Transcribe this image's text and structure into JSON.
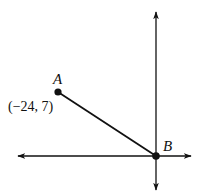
{
  "diagram": {
    "type": "coordinate-plane",
    "axes": {
      "color": "#111111",
      "origin_px": [
        156,
        156
      ],
      "x_axis": {
        "left_px": 16,
        "right_px": 193,
        "y_px": 156
      },
      "y_axis": {
        "top_px": 10,
        "bottom_px": 192,
        "x_px": 156
      }
    },
    "points": [
      {
        "id": "A",
        "label": "A",
        "coord_label": "(−24, 7)",
        "x": -24,
        "y": 7,
        "px": [
          58,
          92
        ]
      },
      {
        "id": "B",
        "label": "B",
        "coord_label": "",
        "x": 0,
        "y": 0,
        "px": [
          156,
          156
        ]
      }
    ],
    "segments": [
      {
        "from": "A",
        "to": "B",
        "label": "AB"
      }
    ]
  },
  "labels": {
    "point_a": "A",
    "point_a_coords": "(−24, 7)",
    "point_b": "B"
  }
}
